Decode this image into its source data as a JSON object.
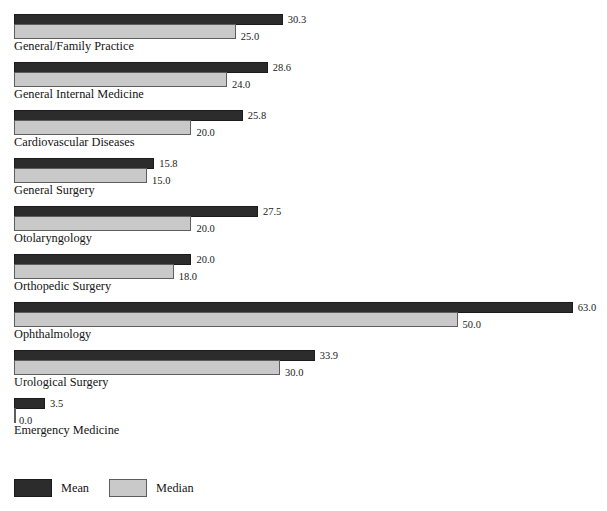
{
  "chart_data": {
    "type": "bar",
    "orientation": "horizontal",
    "title": "",
    "xlabel": "",
    "ylabel": "",
    "grid": false,
    "legend_position": "bottom-left",
    "xlim": [
      0,
      63
    ],
    "categories": [
      "General/Family Practice",
      "General Internal Medicine",
      "Cardiovascular Diseases",
      "General Surgery",
      "Otolaryngology",
      "Orthopedic Surgery",
      "Ophthalmology",
      "Urological Surgery",
      "Emergency Medicine"
    ],
    "series": [
      {
        "name": "Mean",
        "color": "#2c2c2c",
        "values": [
          30.3,
          28.6,
          25.8,
          15.8,
          27.5,
          20.0,
          63.0,
          33.9,
          3.5
        ],
        "labels": [
          "30.3",
          "28.6",
          "25.8",
          "15.8",
          "27.5",
          "20.0",
          "63.0",
          "33.9",
          "3.5"
        ]
      },
      {
        "name": "Median",
        "color": "#c9c9c9",
        "values": [
          25.0,
          24.0,
          20.0,
          15.0,
          20.0,
          18.0,
          50.0,
          30.0,
          0.0
        ],
        "labels": [
          "25.0",
          "24.0",
          "20.0",
          "15.0",
          "20.0",
          "18.0",
          "50.0",
          "30.0",
          "0.0"
        ]
      }
    ]
  },
  "legend": {
    "items": [
      {
        "label": "Mean",
        "swatch": "mean"
      },
      {
        "label": "Median",
        "swatch": "median"
      }
    ]
  }
}
